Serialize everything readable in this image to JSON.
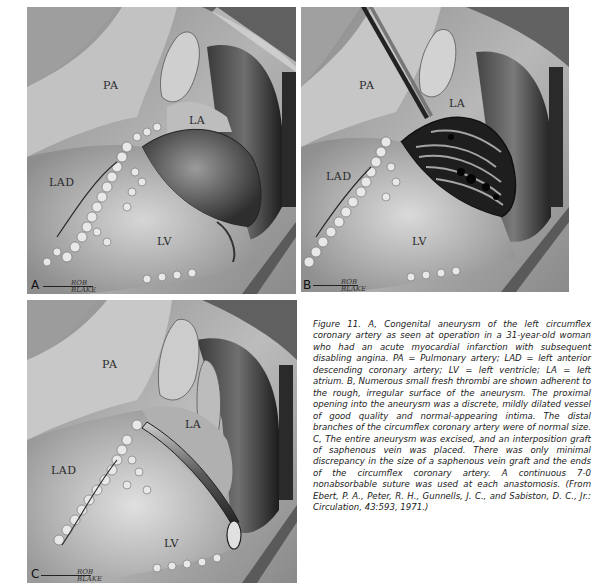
{
  "figure": {
    "panels": [
      {
        "id": "A",
        "letter": "A",
        "labels": {
          "pa": "PA",
          "la": "LA",
          "lad": "LAD",
          "lv": "LV"
        },
        "signature": "ROB BLAKE"
      },
      {
        "id": "B",
        "letter": "B",
        "labels": {
          "pa": "PA",
          "la": "LA",
          "lad": "LAD",
          "lv": "LV"
        },
        "signature": "ROB BLAKE"
      },
      {
        "id": "C",
        "letter": "C",
        "labels": {
          "pa": "PA",
          "la": "LA",
          "lad": "LAD",
          "lv": "LV"
        },
        "signature": "ROB BLAKE"
      }
    ],
    "caption": "Figure 11. A, Congenital aneurysm of the left circumflex coronary artery as seen at operation in a 31-year-old woman who had an acute myocardial infarction with subsequent disabling angina. PA = Pulmonary artery; LAD = left anterior descending coronary artery; LV = left ventricle; LA = left atrium. B, Numerous small fresh thrombi are shown adherent to the rough, irregular surface of the aneurysm. The proximal opening into the aneurysm was a discrete, mildly dilated vessel of good quality and normal-appearing intima. The distal branches of the circumflex coronary artery were of normal size. C, The entire aneurysm was excised, and an interposition graft of saphenous vein was placed. There was only minimal discrepancy in the size of a saphenous vein graft and the ends of the circumflex coronary artery. A continuous 7-0 nonabsorbable suture was used at each anastomosis. (From Ebert, P. A., Peter, R. H., Gunnells, J. C., and Sabiston, D. C., Jr.: Circulation, 43:593, 1971.)"
  }
}
